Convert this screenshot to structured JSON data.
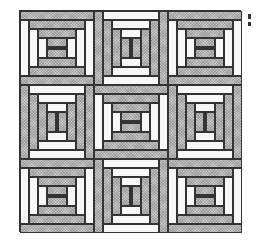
{
  "figure": {
    "grid": {
      "rows": 3,
      "cols": 3
    },
    "layout": [
      [
        "horizontal",
        "vertical",
        "horizontal"
      ],
      [
        "vertical",
        "horizontal",
        "vertical"
      ],
      [
        "horizontal",
        "vertical",
        "horizontal"
      ]
    ],
    "colors": {
      "gray_fabric": "#c8c8c8",
      "white_fabric": "#f7f7f7",
      "center_square": "#222222",
      "outline": "#333333"
    }
  }
}
